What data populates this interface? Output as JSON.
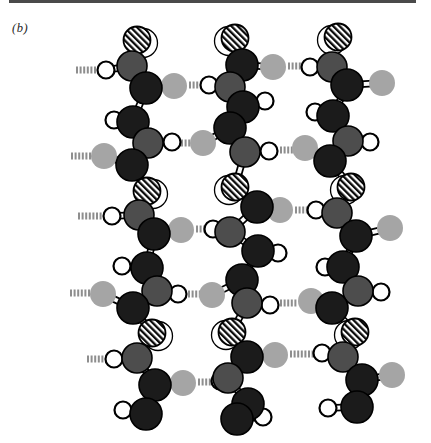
{
  "figure": {
    "panel_label": "(b)",
    "canvas": {
      "width": 431,
      "height": 443,
      "background": "#ffffff"
    },
    "top_rule": {
      "x": 9,
      "y": 0,
      "width": 407,
      "height": 3,
      "color": "#4a4a4a"
    }
  },
  "atom_styles": {
    "C": {
      "name": "carbon",
      "r": 16,
      "fill": "#1b1b1b",
      "stroke": "#000000",
      "stroke_width": 1.6
    },
    "N": {
      "name": "nitrogen",
      "r": 15,
      "fill": "#4d4d4d",
      "stroke": "#000000",
      "stroke_width": 1.6
    },
    "O": {
      "name": "oxygen",
      "r": 13,
      "fill": "#a5a5a5",
      "stroke": "none",
      "stroke_width": 0
    },
    "H": {
      "name": "hydrogen",
      "r": 8.5,
      "fill": "#ffffff",
      "stroke": "#000000",
      "stroke_width": 2.2
    },
    "R": {
      "name": "side-group",
      "r": 13.5,
      "fill": "hatch",
      "stroke": "#000000",
      "stroke_width": 1.8
    }
  },
  "bond_style": {
    "outline": "#000000",
    "core": "#fafafa",
    "outline_width": 7.5,
    "core_width": 4
  },
  "hbond_style": {
    "color": "#8e8e8e",
    "tick_width": 2,
    "tick_height": 7,
    "pitch": 3.6
  },
  "chains": [
    {
      "name": "chain-1",
      "halo_dx": 6,
      "backbone": [
        [
          "R",
          137,
          40
        ],
        [
          "N",
          132,
          66
        ],
        [
          "C",
          146,
          88
        ],
        [
          "C",
          133,
          122
        ],
        [
          "N",
          148,
          143
        ],
        [
          "C",
          132,
          165
        ],
        [
          "R",
          147,
          191
        ],
        [
          "N",
          139,
          215
        ],
        [
          "C",
          154,
          234
        ],
        [
          "C",
          147,
          268
        ],
        [
          "N",
          157,
          291
        ],
        [
          "C",
          133,
          308
        ],
        [
          "R",
          152,
          333
        ],
        [
          "N",
          137,
          358
        ],
        [
          "C",
          155,
          385
        ],
        [
          "C",
          146,
          414
        ]
      ],
      "side": [
        [
          1,
          "H",
          106,
          70
        ],
        [
          2,
          "O",
          174,
          86
        ],
        [
          3,
          "H",
          114,
          120
        ],
        [
          4,
          "H",
          172,
          142
        ],
        [
          5,
          "O",
          104,
          156
        ],
        [
          7,
          "H",
          112,
          216
        ],
        [
          8,
          "O",
          181,
          230
        ],
        [
          9,
          "H",
          122,
          266
        ],
        [
          10,
          "H",
          178,
          294
        ],
        [
          11,
          "O",
          103,
          294
        ],
        [
          13,
          "H",
          114,
          359
        ],
        [
          14,
          "O",
          183,
          383
        ],
        [
          15,
          "H",
          123,
          410
        ]
      ]
    },
    {
      "name": "chain-2",
      "halo_dx": -6,
      "backbone": [
        [
          "R",
          235,
          38
        ],
        [
          "C",
          242,
          65
        ],
        [
          "N",
          230,
          87
        ],
        [
          "C",
          243,
          107
        ],
        [
          "C",
          230,
          128
        ],
        [
          "N",
          245,
          152
        ],
        [
          "R",
          235,
          187
        ],
        [
          "C",
          257,
          207
        ],
        [
          "N",
          230,
          232
        ],
        [
          "C",
          258,
          251
        ],
        [
          "C",
          242,
          280
        ],
        [
          "N",
          247,
          303
        ],
        [
          "R",
          232,
          332
        ],
        [
          "C",
          247,
          357
        ],
        [
          "N",
          228,
          378
        ],
        [
          "C",
          248,
          404
        ],
        [
          "C",
          237,
          419
        ]
      ],
      "side": [
        [
          1,
          "O",
          273,
          67
        ],
        [
          2,
          "H",
          209,
          85
        ],
        [
          3,
          "H",
          265,
          101
        ],
        [
          4,
          "O",
          203,
          143
        ],
        [
          5,
          "H",
          269,
          151
        ],
        [
          7,
          "O",
          280,
          210
        ],
        [
          8,
          "H",
          213,
          229
        ],
        [
          9,
          "H",
          278,
          253
        ],
        [
          10,
          "O",
          212,
          295
        ],
        [
          11,
          "H",
          270,
          305
        ],
        [
          13,
          "O",
          275,
          355
        ],
        [
          14,
          "H",
          220,
          381
        ],
        [
          16,
          "H",
          263,
          417
        ]
      ]
    },
    {
      "name": "chain-3",
      "halo_dx": -6,
      "backbone": [
        [
          "R",
          338,
          37
        ],
        [
          "N",
          332,
          67
        ],
        [
          "C",
          347,
          85
        ],
        [
          "C",
          333,
          116
        ],
        [
          "N",
          348,
          141
        ],
        [
          "C",
          330,
          161
        ],
        [
          "R",
          351,
          187
        ],
        [
          "N",
          337,
          213
        ],
        [
          "C",
          356,
          236
        ],
        [
          "C",
          343,
          267
        ],
        [
          "N",
          358,
          291
        ],
        [
          "C",
          332,
          308
        ],
        [
          "R",
          355,
          332
        ],
        [
          "N",
          343,
          357
        ],
        [
          "C",
          362,
          380
        ],
        [
          "C",
          357,
          407
        ]
      ],
      "side": [
        [
          1,
          "H",
          310,
          67
        ],
        [
          2,
          "O",
          382,
          83
        ],
        [
          3,
          "H",
          315,
          112
        ],
        [
          4,
          "H",
          370,
          142
        ],
        [
          5,
          "O",
          305,
          148
        ],
        [
          7,
          "H",
          316,
          210
        ],
        [
          8,
          "O",
          390,
          228
        ],
        [
          9,
          "H",
          325,
          267
        ],
        [
          10,
          "H",
          381,
          292
        ],
        [
          11,
          "O",
          311,
          301
        ],
        [
          13,
          "H",
          322,
          353
        ],
        [
          14,
          "O",
          392,
          375
        ],
        [
          15,
          "H",
          328,
          408
        ]
      ]
    }
  ],
  "hydrogen_bonds": [
    {
      "x1": 76,
      "x2": 97,
      "y": 70
    },
    {
      "x1": 71,
      "x2": 93,
      "y": 156
    },
    {
      "x1": 78,
      "x2": 104,
      "y": 216
    },
    {
      "x1": 70,
      "x2": 90,
      "y": 293
    },
    {
      "x1": 87,
      "x2": 107,
      "y": 359
    },
    {
      "x1": 189,
      "x2": 199,
      "y": 85
    },
    {
      "x1": 181,
      "x2": 192,
      "y": 143
    },
    {
      "x1": 196,
      "x2": 204,
      "y": 229
    },
    {
      "x1": 188,
      "x2": 198,
      "y": 294
    },
    {
      "x1": 198,
      "x2": 210,
      "y": 382
    },
    {
      "x1": 288,
      "x2": 300,
      "y": 66
    },
    {
      "x1": 280,
      "x2": 291,
      "y": 150
    },
    {
      "x1": 295,
      "x2": 306,
      "y": 210
    },
    {
      "x1": 280,
      "x2": 296,
      "y": 303
    },
    {
      "x1": 290,
      "x2": 311,
      "y": 354
    }
  ]
}
